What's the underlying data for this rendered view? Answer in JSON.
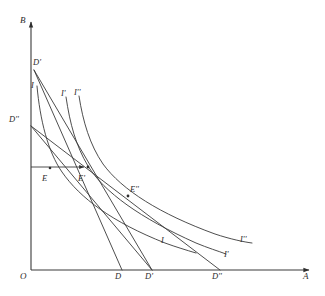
{
  "figure": {
    "width": 325,
    "height": 296,
    "background_color": "#ffffff",
    "line_color": "#3a3a3a"
  },
  "axes": {
    "vertical_label": "B",
    "horizontal_label": "A",
    "origin_label": "O",
    "origin_px": {
      "x": 31,
      "y": 270
    },
    "vertical_top_px": {
      "x": 31,
      "y": 20
    },
    "horizontal_right_px": {
      "x": 311,
      "y": 270
    }
  },
  "budget_lines": [
    {
      "name": "budget-line-D-prime",
      "label": "D'",
      "label_position": "top-left",
      "label_px": {
        "x": 33,
        "y": 62
      },
      "x_intercept_label": "D",
      "x_intercept_label_px": {
        "x": 118,
        "y": 277
      },
      "from_px": {
        "x": 34,
        "y": 70
      },
      "to_px": {
        "x": 122,
        "y": 270
      }
    },
    {
      "name": "budget-line-D-double-prime",
      "label": "D''",
      "label_position": "mid-left",
      "label_px": {
        "x": 10,
        "y": 119
      },
      "x_intercept_label": "D'",
      "x_intercept_label_px": {
        "x": 148,
        "y": 277
      },
      "from_px": {
        "x": 31,
        "y": 126
      },
      "to_px": {
        "x": 152,
        "y": 270
      }
    },
    {
      "name": "budget-line-outer",
      "label": "",
      "x_intercept_label": "D''",
      "x_intercept_label_px": {
        "x": 216,
        "y": 277
      },
      "from_px": {
        "x": 31,
        "y": 126
      },
      "to_px": {
        "x": 220,
        "y": 270
      }
    }
  ],
  "indifference_curves": [
    {
      "name": "indifference-curve-I",
      "label": "I",
      "top_label_px": {
        "x": 33,
        "y": 85
      },
      "right_label": "I",
      "right_label_px": {
        "x": 163,
        "y": 241
      }
    },
    {
      "name": "indifference-curve-I-prime",
      "label": "I'",
      "top_label_px": {
        "x": 63,
        "y": 94
      },
      "right_label": "I'",
      "right_label_px": {
        "x": 226,
        "y": 254
      }
    },
    {
      "name": "indifference-curve-I-double-prime",
      "label": "I''",
      "top_label_px": {
        "x": 76,
        "y": 93
      },
      "right_label": "I''",
      "right_label_px": {
        "x": 242,
        "y": 239
      }
    }
  ],
  "equilibrium_points": [
    {
      "name": "point-E",
      "label": "E",
      "label_px": {
        "x": 44,
        "y": 178
      },
      "dot_px": {
        "x": 50,
        "y": 168
      }
    },
    {
      "name": "point-E-prime",
      "label": "E'",
      "label_px": {
        "x": 80,
        "y": 178
      },
      "dot_px": {
        "x": 88,
        "y": 167
      }
    },
    {
      "name": "point-E-double-prime",
      "label": "E''",
      "label_px": {
        "x": 131,
        "y": 189
      },
      "dot_px": {
        "x": 128,
        "y": 196
      }
    }
  ],
  "guide_lines": [
    {
      "name": "horizontal-guide-to-E-prime",
      "from_px": {
        "x": 31,
        "y": 167
      },
      "to_px": {
        "x": 88,
        "y": 167
      },
      "has_arrow": true
    }
  ]
}
